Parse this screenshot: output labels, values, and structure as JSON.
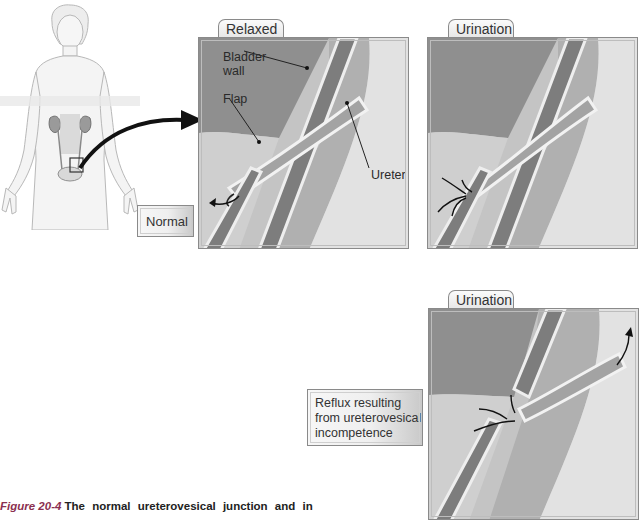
{
  "figure": {
    "number_label": "Figure 20-4",
    "caption_text": "The normal ureterovesical junction and in"
  },
  "body_illustration": {
    "label": "Normal"
  },
  "panels": [
    {
      "tab": "Relaxed",
      "annotations": [
        "Bladder wall",
        "Flap",
        "Ureter"
      ],
      "annotation_lines": {
        "bladder_wall_1": "Bladder",
        "bladder_wall_2": "wall",
        "flap": "Flap",
        "ureter": "Ureter"
      }
    },
    {
      "tab": "Urination"
    },
    {
      "tab": "Urination"
    }
  ],
  "reflux_label": {
    "line1": "Reflux resulting",
    "line2": "from ureterovesical",
    "line3": "incompetence"
  },
  "colors": {
    "bladder_dark": "#8f8f8f",
    "bladder_light": "#c8c8c8",
    "wall_texture": "#7a7a7a",
    "frame": "#8a8a8a",
    "caption_accent": "#8b3050"
  }
}
